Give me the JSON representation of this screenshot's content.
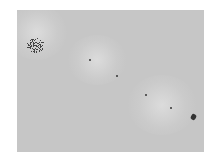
{
  "image": {
    "description": "Grayscale microscopy-style image with a dense particle cluster at upper-left, four isolated dark dots along a diagonal, and a small dark aggregate at lower-right",
    "colors": {
      "background": "#c6c6c6",
      "particles": "#333333",
      "halo": "#e1e1e1"
    },
    "features": [
      {
        "name": "dense-cluster",
        "location": "upper-left"
      },
      {
        "name": "dot-1",
        "location": "upper-center"
      },
      {
        "name": "dot-2",
        "location": "center"
      },
      {
        "name": "dot-3",
        "location": "center-right"
      },
      {
        "name": "dot-4",
        "location": "lower-right"
      },
      {
        "name": "aggregate",
        "location": "lower-right-corner"
      }
    ]
  },
  "caption": ""
}
